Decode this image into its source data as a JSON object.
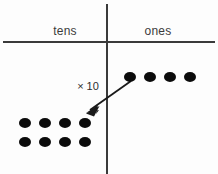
{
  "diagram": {
    "title_visible": false,
    "background_color": "#fdfdfd",
    "line_color": "#3a3a3a",
    "dot_color": "#0b0b0b",
    "text_color": "#3b3b3b",
    "columns": [
      {
        "id": "tens",
        "label": "tens",
        "center_x": 65
      },
      {
        "id": "ones",
        "label": "ones",
        "center_x": 158
      }
    ],
    "divider": {
      "vertical_x": 107,
      "vertical_y1": 4,
      "vertical_y2": 174,
      "horizontal_y": 42,
      "horizontal_x1": 3,
      "horizontal_x2": 215
    },
    "annotation": {
      "label": "× 10",
      "x": 88,
      "y": 86
    },
    "arrow": {
      "from_x": 131,
      "from_y": 81,
      "to_x": 87,
      "to_y": 112
    },
    "ones_dots": {
      "count": 4,
      "rows": [
        {
          "y": 77,
          "xs": [
            130,
            150,
            170,
            190
          ]
        }
      ]
    },
    "tens_dots": {
      "count": 8,
      "rows": [
        {
          "y": 123,
          "xs": [
            25,
            45,
            65,
            85
          ]
        },
        {
          "y": 142,
          "xs": [
            25,
            45,
            65,
            85
          ]
        }
      ]
    },
    "dot_size": {
      "width": 12,
      "height": 10
    }
  }
}
